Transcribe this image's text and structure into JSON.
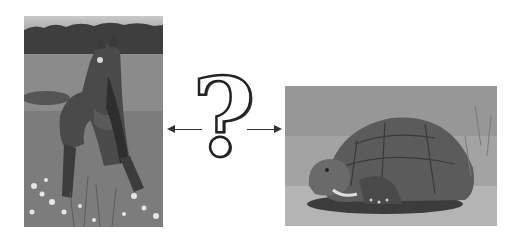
{
  "figure": {
    "left_image": {
      "subject": "horse",
      "description": "Dark horse standing in a grassy field with flowers, trees in background",
      "tone": "grayscale"
    },
    "right_image": {
      "subject": "tortoise",
      "description": "Tortoise resting on dry ground with grass",
      "tone": "grayscale"
    },
    "center_symbol": "?",
    "arrows": [
      "left-arrow",
      "right-arrow"
    ]
  }
}
